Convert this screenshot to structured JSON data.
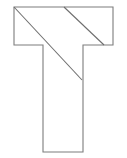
{
  "figure": {
    "name": "t-shape-with-diagonals",
    "canvas": {
      "width": 127,
      "height": 158,
      "background_color": "#ffffff"
    },
    "style": {
      "outline_color": "#7d7d7d",
      "diagonal_color": "#6e6e6e",
      "stroke_width": 1.1,
      "fill": "none"
    },
    "outline": {
      "name": "t-polygon",
      "points": "14,7 113,7 113,45 83,45 83,152 43,152 43,45 14,45",
      "closed": true,
      "vertices": [
        {
          "label": "top-left",
          "x": 14,
          "y": 7
        },
        {
          "label": "top-right",
          "x": 113,
          "y": 7
        },
        {
          "label": "right-arm-bottom-right",
          "x": 113,
          "y": 45
        },
        {
          "label": "right-arm-inner-corner",
          "x": 83,
          "y": 45
        },
        {
          "label": "stem-bottom-right",
          "x": 83,
          "y": 152
        },
        {
          "label": "stem-bottom-left",
          "x": 43,
          "y": 152
        },
        {
          "label": "stem-top-left",
          "x": 43,
          "y": 45
        },
        {
          "label": "left-arm-bottom-left",
          "x": 14,
          "y": 45
        }
      ]
    },
    "diagonals": [
      {
        "name": "long-diagonal",
        "x1": 14,
        "y1": 7,
        "x2": 82,
        "y2": 80
      },
      {
        "name": "short-diagonal",
        "x1": 64,
        "y1": 7,
        "x2": 104,
        "y2": 45
      }
    ]
  }
}
